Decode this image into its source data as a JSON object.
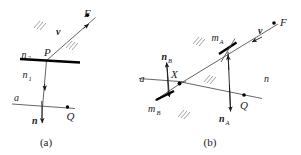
{
  "figure": {
    "panels": [
      {
        "id": "a",
        "caption": "(a)",
        "labels": {
          "point_f": "F",
          "point_p": "P",
          "point_q": "Q",
          "vector_v": "v",
          "vector_n": "n",
          "index_upper": "n",
          "index_upper_sub": "2",
          "index_lower": "n",
          "index_lower_sub": "1",
          "line_a": "a"
        }
      },
      {
        "id": "b",
        "caption": "(b)",
        "labels": {
          "point_f": "F",
          "point_x": "X",
          "point_q": "Q",
          "vector_v": "v",
          "vector_n_a": "n",
          "vector_n_a_sub": "A",
          "vector_n_b": "n",
          "vector_n_b_sub": "B",
          "mirror_a": "m",
          "mirror_a_sub": "A",
          "mirror_b": "m",
          "mirror_b_sub": "B",
          "index_n": "n",
          "line_a": "a"
        }
      }
    ],
    "colors": {
      "ink": "#000000",
      "ray": "#555555",
      "hatch": "#7a7a7a",
      "background": "#ffffff"
    }
  }
}
